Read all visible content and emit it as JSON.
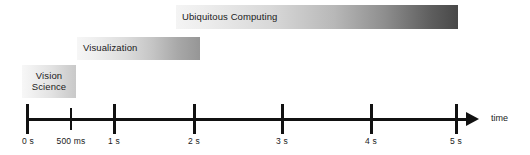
{
  "figure": {
    "type": "timeline",
    "axis": {
      "title": "time",
      "direction": "left-to-right",
      "arrow": true,
      "start_label": "0 s",
      "end_label": "5 s",
      "ticks": [
        {
          "label": "0 s",
          "seconds": 0,
          "kind": "major"
        },
        {
          "label": "500 ms",
          "seconds": 0.5,
          "kind": "minor"
        },
        {
          "label": "1 s",
          "seconds": 1,
          "kind": "major"
        },
        {
          "label": "2 s",
          "seconds": 2,
          "kind": "major"
        },
        {
          "label": "3 s",
          "seconds": 3,
          "kind": "major"
        },
        {
          "label": "4 s",
          "seconds": 4,
          "kind": "major"
        },
        {
          "label": "5 s",
          "seconds": 5,
          "kind": "major"
        }
      ]
    },
    "bars": [
      {
        "id": "ubiquitous",
        "label": "Ubiquitous Computing",
        "start_seconds": 1.7,
        "end_seconds": 5.0,
        "gradient_from": "#f4f4f4",
        "gradient_to": "#484848"
      },
      {
        "id": "visualization",
        "label": "Visualization",
        "start_seconds": 0.58,
        "end_seconds": 2.03,
        "gradient_from": "#f6f6f6",
        "gradient_to": "#969696"
      },
      {
        "id": "vision",
        "label_line1": "Vision",
        "label_line2": "Science",
        "label": "Vision Science",
        "start_seconds": 0.0,
        "end_seconds": 0.57,
        "gradient_from": "#f7f7f7",
        "gradient_to": "#c9c9c9"
      }
    ]
  }
}
